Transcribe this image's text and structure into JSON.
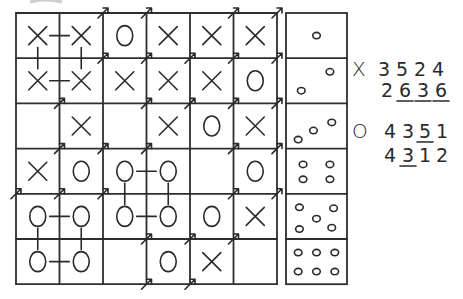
{
  "grid": {
    "rows": [
      [
        "X",
        "X",
        "O",
        "X",
        "X",
        "X"
      ],
      [
        "X",
        "X",
        "X",
        "X",
        "X",
        "O"
      ],
      [
        "",
        "X",
        "",
        "X",
        "O",
        "X"
      ],
      [
        "X",
        "O",
        "O",
        "O",
        "",
        "O"
      ],
      [
        "O",
        "O",
        "O",
        "O",
        "O",
        "X"
      ],
      [
        "O",
        "O",
        "",
        "O",
        "X",
        ""
      ]
    ],
    "links": [
      {
        "from": [
          0,
          0
        ],
        "to": [
          0,
          1
        ]
      },
      {
        "from": [
          1,
          0
        ],
        "to": [
          1,
          1
        ]
      },
      {
        "from": [
          0,
          0
        ],
        "to": [
          1,
          0
        ]
      },
      {
        "from": [
          0,
          1
        ],
        "to": [
          1,
          1
        ]
      },
      {
        "from": [
          3,
          2
        ],
        "to": [
          3,
          3
        ]
      },
      {
        "from": [
          3,
          2
        ],
        "to": [
          4,
          2
        ]
      },
      {
        "from": [
          3,
          3
        ],
        "to": [
          4,
          3
        ]
      },
      {
        "from": [
          4,
          0
        ],
        "to": [
          4,
          1
        ]
      },
      {
        "from": [
          4,
          2
        ],
        "to": [
          4,
          3
        ]
      },
      {
        "from": [
          4,
          0
        ],
        "to": [
          5,
          0
        ]
      },
      {
        "from": [
          4,
          1
        ],
        "to": [
          5,
          1
        ]
      },
      {
        "from": [
          5,
          0
        ],
        "to": [
          5,
          1
        ]
      }
    ]
  },
  "dice": [
    1,
    2,
    3,
    4,
    5,
    6
  ],
  "sequences": {
    "x": {
      "symbol": "X",
      "line1": [
        "3",
        "5",
        "2",
        "4"
      ],
      "line2": [
        "2",
        "6",
        "3",
        "6"
      ],
      "line1_underlined": [],
      "line2_underlined": [
        1,
        2,
        3
      ]
    },
    "o": {
      "symbol": "O",
      "line1": [
        "4",
        "3",
        "5",
        "1"
      ],
      "line2": [
        "4",
        "3",
        "1",
        "2"
      ],
      "line1_underlined": [
        2
      ],
      "line2_underlined": [
        1
      ]
    }
  },
  "colors": {
    "ink": "#2a2a2a",
    "paper": "#ffffff"
  }
}
